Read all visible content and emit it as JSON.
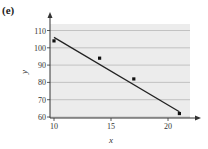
{
  "panel_label": "(e)",
  "chart_data": {
    "type": "scatter",
    "title": "",
    "xlabel": "x",
    "ylabel": "y",
    "xlim": [
      9.6,
      22
    ],
    "ylim": [
      60,
      115
    ],
    "x_ticks": [
      10,
      15,
      20
    ],
    "y_ticks": [
      60,
      70,
      80,
      90,
      100,
      110
    ],
    "grid": "horizontal",
    "legend": null,
    "series": [
      {
        "name": "data points",
        "x": [
          10,
          14,
          17,
          21
        ],
        "y": [
          104,
          94,
          82,
          62
        ]
      },
      {
        "name": "line of best fit",
        "type": "line",
        "x": [
          10,
          21
        ],
        "y": [
          106,
          63
        ]
      }
    ],
    "colors": {
      "plot_background": "#ececec",
      "grid": "#b8b8b8",
      "line": "#222222",
      "points": "#111111"
    }
  }
}
